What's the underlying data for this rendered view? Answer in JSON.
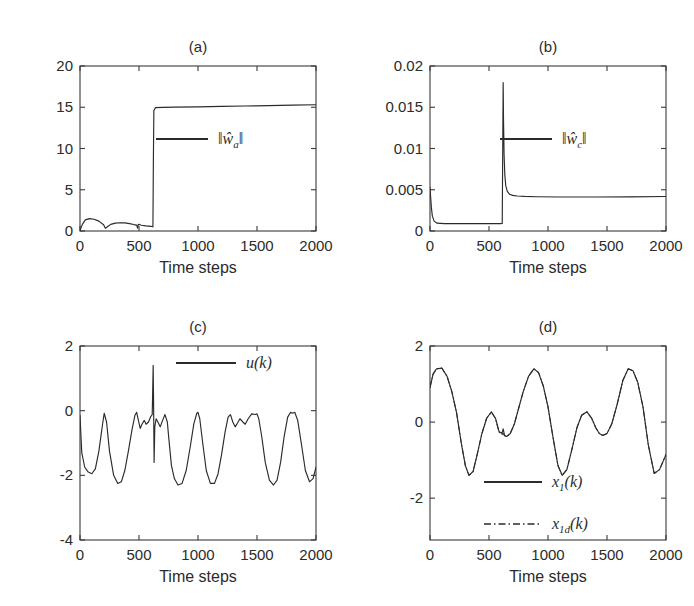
{
  "figure": {
    "width": 694,
    "height": 606,
    "background": "#ffffff",
    "line_color": "#2b2b2b",
    "axis_color": "#3a3a3a"
  },
  "panels": [
    {
      "id": "a",
      "title": "(a)",
      "xlabel": "Time steps",
      "ylabel": "",
      "xticks": [
        0,
        500,
        1000,
        1500,
        2000
      ],
      "xticklabels": [
        "0",
        "500",
        "1000",
        "1500",
        "2000"
      ],
      "yticks": [
        0,
        5,
        10,
        15,
        20
      ],
      "yticklabels": [
        "0",
        "5",
        "10",
        "15",
        "20"
      ],
      "xlim": [
        0,
        2000
      ],
      "ylim": [
        0,
        20
      ],
      "legend": [
        {
          "label": "||ŵ_a||",
          "style": "solid"
        }
      ]
    },
    {
      "id": "b",
      "title": "(b)",
      "xlabel": "Time steps",
      "ylabel": "",
      "xticks": [
        0,
        500,
        1000,
        1500,
        2000
      ],
      "xticklabels": [
        "0",
        "500",
        "1000",
        "1500",
        "2000"
      ],
      "yticks": [
        0,
        0.005,
        0.01,
        0.015,
        0.02
      ],
      "yticklabels": [
        "0",
        "0.005",
        "0.01",
        "0.015",
        "0.02"
      ],
      "xlim": [
        0,
        2000
      ],
      "ylim": [
        0,
        0.02
      ],
      "legend": [
        {
          "label": "||ŵ_c||",
          "style": "solid"
        }
      ]
    },
    {
      "id": "c",
      "title": "(c)",
      "xlabel": "Time steps",
      "ylabel": "",
      "xticks": [
        0,
        500,
        1000,
        1500,
        2000
      ],
      "xticklabels": [
        "0",
        "500",
        "1000",
        "1500",
        "2000"
      ],
      "yticks": [
        -4,
        -2,
        0,
        2
      ],
      "yticklabels": [
        "-4",
        "-2",
        "0",
        "2"
      ],
      "xlim": [
        0,
        2000
      ],
      "ylim": [
        -4,
        2
      ],
      "legend": [
        {
          "label": "u(k)",
          "style": "solid"
        }
      ]
    },
    {
      "id": "d",
      "title": "(d)",
      "xlabel": "Time steps",
      "ylabel": "",
      "xticks": [
        0,
        500,
        1000,
        1500,
        2000
      ],
      "xticklabels": [
        "0",
        "500",
        "1000",
        "1500",
        "2000"
      ],
      "yticks": [
        -2,
        0,
        2
      ],
      "yticklabels": [
        "-2",
        "0",
        "2"
      ],
      "xlim": [
        0,
        2000
      ],
      "ylim": [
        -3.1,
        2
      ],
      "legend": [
        {
          "label": "x_1(k)",
          "style": "solid"
        },
        {
          "label": "x_1d(k)",
          "style": "dashdot"
        }
      ]
    }
  ],
  "chart_data": [
    {
      "panel": "a",
      "type": "line",
      "title": "(a)",
      "xlabel": "Time steps",
      "ylabel": "",
      "xlim": [
        0,
        2000
      ],
      "ylim": [
        0,
        20
      ],
      "grid": false,
      "legend_position": "center",
      "series": [
        {
          "name": "||w_a_hat||",
          "style": "solid",
          "description": "Actor weight norm: small transient humps below 2 until step ~620, then step jump to ~15 and slow creep to 15.3",
          "x": [
            0,
            20,
            45,
            80,
            120,
            160,
            200,
            215,
            235,
            260,
            300,
            340,
            380,
            420,
            455,
            480,
            488,
            495,
            505,
            520,
            560,
            600,
            615,
            618,
            622,
            626,
            640,
            700,
            800,
            1000,
            1200,
            1400,
            1600,
            1800,
            2000
          ],
          "y": [
            0.05,
            0.8,
            1.35,
            1.5,
            1.42,
            1.2,
            0.75,
            0.32,
            0.55,
            0.8,
            0.95,
            1.0,
            0.98,
            0.9,
            0.78,
            0.72,
            0.35,
            0.82,
            0.78,
            0.7,
            0.62,
            0.56,
            0.54,
            0.5,
            9.0,
            14.6,
            14.95,
            14.98,
            15.02,
            15.05,
            15.1,
            15.15,
            15.2,
            15.25,
            15.3
          ]
        }
      ]
    },
    {
      "panel": "b",
      "type": "line",
      "title": "(b)",
      "xlabel": "Time steps",
      "ylabel": "",
      "xlim": [
        0,
        2000
      ],
      "ylim": [
        0,
        0.02
      ],
      "grid": false,
      "legend_position": "center",
      "series": [
        {
          "name": "||w_c_hat||",
          "style": "solid",
          "description": "Critic weight norm: starts at 0.0053, drops instantly to ~0.0009 flat baseline, narrow spike to 0.018 at step ~620, decays to ~0.0042 plateau",
          "x": [
            0,
            5,
            12,
            20,
            35,
            60,
            120,
            300,
            500,
            600,
            612,
            616,
            620,
            623,
            628,
            634,
            642,
            655,
            675,
            700,
            740,
            800,
            900,
            1100,
            1400,
            1700,
            2000
          ],
          "y": [
            0.0053,
            0.0042,
            0.0028,
            0.0018,
            0.0012,
            0.00095,
            0.0009,
            0.0009,
            0.0009,
            0.0009,
            0.00091,
            0.0092,
            0.018,
            0.0135,
            0.0092,
            0.0068,
            0.0055,
            0.0048,
            0.00445,
            0.00432,
            0.00424,
            0.00419,
            0.00415,
            0.00412,
            0.00412,
            0.00414,
            0.00418
          ]
        }
      ]
    },
    {
      "panel": "c",
      "type": "line",
      "title": "(c)",
      "xlabel": "Time steps",
      "ylabel": "",
      "xlim": [
        0,
        2000
      ],
      "ylim": [
        -4,
        2
      ],
      "grid": false,
      "legend_position": "upper right",
      "series": [
        {
          "name": "u(k)",
          "style": "solid",
          "description": "Control input: quasi-periodic oscillation between -2.3 and 0 with alternating tall single peaks and shallow double humps; narrow upward spike to 1.4 and downward notch to -1.6 at step ~620",
          "x": [
            0,
            15,
            40,
            70,
            100,
            130,
            160,
            190,
            205,
            225,
            250,
            285,
            320,
            350,
            380,
            410,
            440,
            465,
            480,
            495,
            510,
            525,
            545,
            560,
            580,
            600,
            612,
            616,
            620,
            624,
            628,
            634,
            645,
            660,
            680,
            700,
            720,
            740,
            755,
            775,
            800,
            830,
            865,
            900,
            935,
            965,
            990,
            1000,
            1015,
            1040,
            1070,
            1105,
            1140,
            1170,
            1200,
            1230,
            1255,
            1275,
            1295,
            1315,
            1335,
            1355,
            1380,
            1400,
            1425,
            1455,
            1485,
            1500,
            1515,
            1540,
            1570,
            1605,
            1640,
            1670,
            1700,
            1730,
            1760,
            1785,
            1800,
            1820,
            1845,
            1875,
            1910,
            1945,
            1975,
            2000
          ],
          "y": [
            -0.15,
            -1.3,
            -1.75,
            -1.9,
            -1.95,
            -1.8,
            -1.25,
            -0.45,
            -0.08,
            -0.35,
            -1.25,
            -2.0,
            -2.25,
            -2.2,
            -1.85,
            -1.25,
            -0.6,
            -0.15,
            -0.05,
            -0.3,
            -0.55,
            -0.42,
            -0.3,
            -0.42,
            -0.35,
            -0.18,
            -0.12,
            0.6,
            1.4,
            0.1,
            -1.6,
            -0.5,
            -0.25,
            -0.35,
            -0.5,
            -0.3,
            -0.12,
            -0.35,
            -0.95,
            -1.7,
            -2.1,
            -2.3,
            -2.25,
            -1.85,
            -1.1,
            -0.4,
            -0.08,
            -0.05,
            -0.25,
            -1.0,
            -1.85,
            -2.25,
            -2.25,
            -1.95,
            -1.35,
            -0.65,
            -0.2,
            -0.12,
            -0.35,
            -0.5,
            -0.38,
            -0.25,
            -0.35,
            -0.42,
            -0.25,
            -0.1,
            -0.12,
            -0.1,
            -0.25,
            -0.8,
            -1.6,
            -2.15,
            -2.3,
            -2.15,
            -1.6,
            -0.8,
            -0.2,
            -0.05,
            -0.08,
            -0.05,
            -0.3,
            -1.0,
            -1.85,
            -2.2,
            -2.1,
            -1.75
          ]
        }
      ]
    },
    {
      "panel": "d",
      "type": "line",
      "title": "(d)",
      "xlabel": "Time steps",
      "ylabel": "",
      "xlim": [
        0,
        2000
      ],
      "ylim": [
        -3.1,
        2
      ],
      "grid": false,
      "legend_position": "lower right",
      "series": [
        {
          "name": "x_1(k)",
          "style": "solid",
          "description": "System state: quasi-periodic wave, peaks ~1.4 at steps 100, 880, 1680; troughs ~-1.4 at 330, 1120, 1900; small shoulder bumps ~0.25 at 520 and 1330; brief glitch at step ~620",
          "x": [
            0,
            25,
            55,
            100,
            145,
            185,
            225,
            265,
            300,
            330,
            365,
            400,
            440,
            480,
            520,
            555,
            585,
            610,
            620,
            632,
            650,
            680,
            715,
            750,
            790,
            835,
            880,
            920,
            960,
            1000,
            1045,
            1085,
            1120,
            1160,
            1200,
            1245,
            1285,
            1330,
            1370,
            1405,
            1435,
            1465,
            1500,
            1540,
            1585,
            1635,
            1680,
            1720,
            1760,
            1805,
            1850,
            1900,
            1945,
            1980,
            2000
          ],
          "y": [
            0.9,
            1.25,
            1.4,
            1.42,
            1.2,
            0.8,
            0.25,
            -0.55,
            -1.15,
            -1.4,
            -1.3,
            -0.85,
            -0.3,
            0.1,
            0.27,
            0.1,
            -0.25,
            -0.3,
            -0.18,
            -0.35,
            -0.38,
            -0.3,
            -0.05,
            0.35,
            0.8,
            1.2,
            1.4,
            1.3,
            0.95,
            0.4,
            -0.45,
            -1.15,
            -1.4,
            -1.25,
            -0.75,
            -0.15,
            0.18,
            0.27,
            0.1,
            -0.15,
            -0.3,
            -0.35,
            -0.3,
            -0.05,
            0.45,
            1.1,
            1.4,
            1.35,
            1.05,
            0.4,
            -0.6,
            -1.35,
            -1.25,
            -1.0,
            -0.85
          ]
        },
        {
          "name": "x_1d(k)",
          "style": "dashdot",
          "description": "Desired reference trajectory, nearly coincident with x_1(k) over the entire run",
          "x": [
            0,
            25,
            55,
            100,
            145,
            185,
            225,
            265,
            300,
            330,
            365,
            400,
            440,
            480,
            520,
            555,
            585,
            610,
            620,
            632,
            650,
            680,
            715,
            750,
            790,
            835,
            880,
            920,
            960,
            1000,
            1045,
            1085,
            1120,
            1160,
            1200,
            1245,
            1285,
            1330,
            1370,
            1405,
            1435,
            1465,
            1500,
            1540,
            1585,
            1635,
            1680,
            1720,
            1760,
            1805,
            1850,
            1900,
            1945,
            1980,
            2000
          ],
          "y": [
            0.92,
            1.26,
            1.4,
            1.42,
            1.2,
            0.8,
            0.25,
            -0.55,
            -1.15,
            -1.4,
            -1.3,
            -0.85,
            -0.3,
            0.1,
            0.26,
            0.09,
            -0.26,
            -0.33,
            -0.3,
            -0.36,
            -0.38,
            -0.3,
            -0.05,
            0.35,
            0.8,
            1.2,
            1.4,
            1.3,
            0.95,
            0.4,
            -0.45,
            -1.15,
            -1.4,
            -1.25,
            -0.75,
            -0.15,
            0.18,
            0.27,
            0.1,
            -0.15,
            -0.3,
            -0.35,
            -0.3,
            -0.05,
            0.45,
            1.1,
            1.4,
            1.35,
            1.05,
            0.4,
            -0.6,
            -1.35,
            -1.25,
            -1.0,
            -0.85
          ]
        }
      ]
    }
  ]
}
